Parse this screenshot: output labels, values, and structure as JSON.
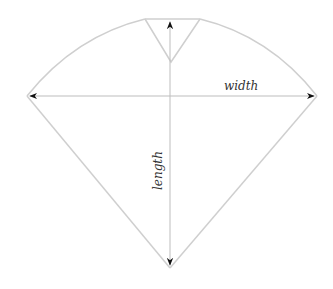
{
  "diagram": {
    "title": "",
    "labels": {
      "width": "width",
      "length": "length"
    },
    "colors": {
      "outline": "#cfcfcf",
      "dimension_line": "#bdbdbd",
      "arrowhead": "#111111",
      "label": "#333333"
    },
    "shape": "kite / cone pattern piece with V-notch at top",
    "dimensions": [
      {
        "name": "width",
        "orientation": "horizontal",
        "from": "left tip",
        "to": "right tip"
      },
      {
        "name": "length",
        "orientation": "vertical",
        "from": "top edge",
        "to": "bottom point"
      }
    ]
  }
}
